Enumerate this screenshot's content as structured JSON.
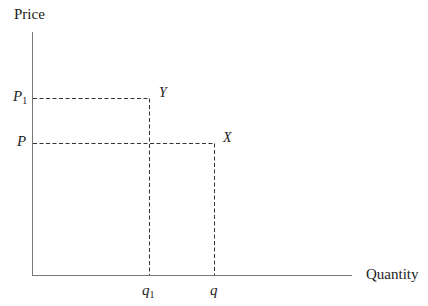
{
  "diagram": {
    "type": "price-quantity diagram",
    "axes": {
      "y_label": "Price",
      "x_label": "Quantity"
    },
    "price_levels": [
      {
        "symbol": "P",
        "subscript": "1",
        "point": "Y"
      },
      {
        "symbol": "P",
        "subscript": "",
        "point": "X"
      }
    ],
    "quantity_levels": [
      {
        "symbol": "q",
        "subscript": "1",
        "point": "Y"
      },
      {
        "symbol": "q",
        "subscript": "",
        "point": "X"
      }
    ],
    "points": [
      {
        "label": "Y",
        "price": "P1",
        "quantity": "q1"
      },
      {
        "label": "X",
        "price": "P",
        "quantity": "q"
      }
    ],
    "colors": {
      "axis": "#666666",
      "dashed": "#333333",
      "text": "#222222"
    }
  }
}
